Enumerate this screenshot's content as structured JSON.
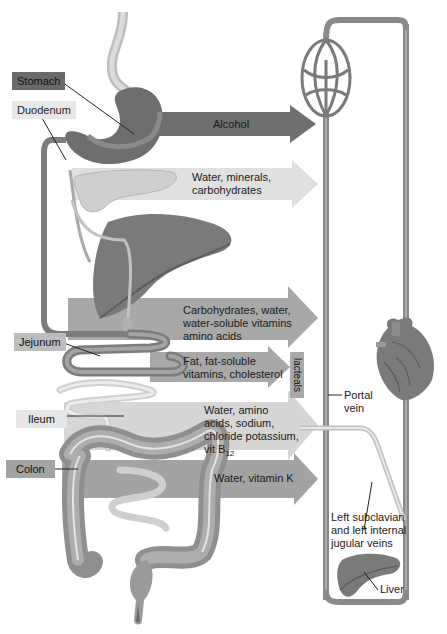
{
  "diagram": {
    "organ_labels": {
      "stomach": "Stomach",
      "duodenum": "Duodenum",
      "jejunum": "Jejunum",
      "ileum": "Ileum",
      "colon": "Colon"
    },
    "arrows": [
      {
        "id": "alcohol",
        "text_lines": [
          "Alcohol"
        ],
        "color": "#6f6f6f"
      },
      {
        "id": "duodenum",
        "text_lines": [
          "Water, minerals,",
          "carbohydrates"
        ],
        "color": "#dcdcdc"
      },
      {
        "id": "jejunum",
        "text_lines": [
          "Carbohydrates, water,",
          "water-soluble vitamins",
          "amino acids"
        ],
        "color": "#a9a9a9"
      },
      {
        "id": "lacteal-fat",
        "text_lines": [
          "Fat, fat-soluble",
          "vitamins, cholesterol"
        ],
        "color": "#a9a9a9"
      },
      {
        "id": "ileum",
        "text_lines": [
          "Water, amino",
          "acids, sodium,",
          "chloride potassium,",
          "vit B"
        ],
        "subscript": "12",
        "color": "#d4d4d4"
      },
      {
        "id": "colon",
        "text_lines": [
          "Water, vitamin K"
        ],
        "color": "#a3a3a3"
      }
    ],
    "lacteals_label": "lacteals",
    "vessel_labels": {
      "portal_vein": [
        "Portal",
        "vein"
      ],
      "subclavian": [
        "Left subclavian",
        "and left internal",
        "jugular veins"
      ],
      "liver": "Liver"
    },
    "colors": {
      "stomach_label_bg": "#6b6b6b",
      "light_label_bg": "#e6e6e6",
      "mid_label_bg": "#bdbdbd",
      "vessel": "#8a8a8a",
      "organ_dark": "#7a7a7a",
      "organ_mid": "#9b9b9b"
    }
  }
}
